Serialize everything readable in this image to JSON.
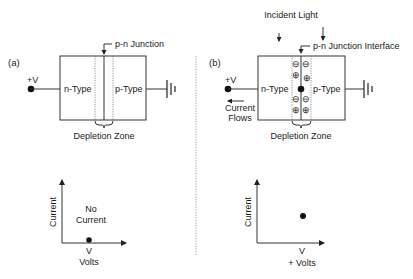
{
  "figure": {
    "colors": {
      "ink": "#1a1a1a",
      "line": "#333333",
      "dotted": "#777777",
      "background": "#ffffff"
    },
    "panel_a": {
      "label": "(a)",
      "voltage_label": "+V",
      "n_type": "n-Type",
      "p_type": "p-Type",
      "junction_label": "p-n Junction",
      "depletion_label": "Depletion Zone",
      "graph": {
        "y_label": "Current",
        "x_label_1": "V",
        "x_label_2": "Volts",
        "annotation_1": "No",
        "annotation_2": "Current"
      }
    },
    "panel_b": {
      "label": "(b)",
      "voltage_label": "+V",
      "n_type": "n-Type",
      "p_type": "p-Type",
      "incident_light_label": "Incident Light",
      "junction_label": "p-n Junction Interface",
      "depletion_label": "Depletion Zone",
      "current_flow_1": "Current",
      "current_flow_2": "Flows",
      "negative_charge": "⊖",
      "positive_charge": "⊕",
      "graph": {
        "y_label": "Current",
        "x_label_1": "V",
        "x_label_2": "+ Volts"
      }
    }
  }
}
